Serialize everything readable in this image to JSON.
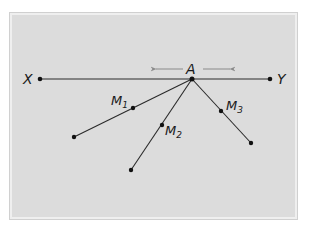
{
  "diagram": {
    "colors": {
      "panel_fill": "#dcdcdc",
      "panel_border": "#efefef",
      "line": "#2a2a2a",
      "arrow": "#8a8a8a",
      "point": "#111111"
    },
    "line_xy": {
      "start_label": "X",
      "end_label": "Y"
    },
    "point_a": {
      "label": "A",
      "movement_hint": "left-right arrows"
    },
    "midpoints": [
      {
        "label": "M",
        "subscript": "1"
      },
      {
        "label": "M",
        "subscript": "2"
      },
      {
        "label": "M",
        "subscript": "3"
      }
    ]
  }
}
